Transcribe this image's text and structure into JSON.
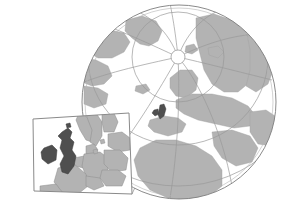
{
  "figure": {
    "caption": "",
    "width": 298,
    "height": 202,
    "background_color": "#ffffff"
  },
  "colors": {
    "ocean": "#ffffff",
    "land": "#b3b3b3",
    "land_stroke": "#8c8c8c",
    "highlight_land": "#4f4f4f",
    "highlight_stroke": "#3a3a3a",
    "graticule": "#9a9a9a",
    "globe_outline": "#7d7d7d",
    "inset_frame": "#8a8a8a",
    "leader_line": "#9a9a9a",
    "inset_background": "#ffffff"
  },
  "globe": {
    "name": "globe",
    "projection": "azimuthal polar",
    "center_x": 179,
    "center_y": 102,
    "radius": 97,
    "pole_ring_radius": 7,
    "pole_ring_center_x": 178,
    "pole_ring_center_y": 57,
    "meridian_count": 9,
    "parallel_count": 3,
    "landmasses": [
      "North America",
      "Greenland",
      "Europe",
      "Asia",
      "Africa",
      "Arabian Peninsula"
    ],
    "highlighted_region": "British Isles"
  },
  "inset": {
    "name": "europe-inset",
    "region": "Northwestern Europe",
    "corners": {
      "top_left_x": 33,
      "top_left_y": 119,
      "top_right_x": 129,
      "top_right_y": 113,
      "bottom_right_x": 132,
      "bottom_right_y": 194,
      "bottom_left_x": 34,
      "bottom_left_y": 191
    },
    "countries": [
      "United Kingdom",
      "Ireland",
      "Norway",
      "Sweden",
      "Denmark",
      "Netherlands",
      "Belgium",
      "Germany",
      "France",
      "Poland",
      "Czechia",
      "Austria",
      "Switzerland"
    ],
    "highlighted_countries": [
      "United Kingdom",
      "Ireland"
    ]
  },
  "leader_lines": {
    "name": "inset-leader-lines",
    "count": 2,
    "from_region": "British Isles on globe",
    "to_region": "inset frame corners"
  }
}
